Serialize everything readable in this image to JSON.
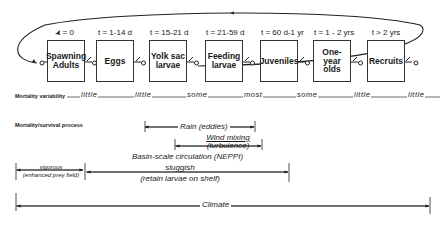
{
  "stages": [
    {
      "time": "t = 0",
      "label": "Spawning Adults"
    },
    {
      "time": "t = 1-14 d",
      "label": "Eggs"
    },
    {
      "time": "t = 15-21 d",
      "label": "Yolk sac larvae"
    },
    {
      "time": "t = 21-59 d",
      "label": "Feeding larvae"
    },
    {
      "time": "t = 60 d-1 yr",
      "label": "Juveniles"
    },
    {
      "time": "t = 1 - 2 yrs",
      "label": "One-year olds"
    },
    {
      "time": "t > 2 yrs",
      "label": "Recruits"
    }
  ],
  "rows": {
    "variability_label": "Mortality variability",
    "process_label": "Mortality/survival process"
  },
  "variability": [
    "little",
    "little",
    "some",
    "most",
    "some",
    "little",
    "little"
  ],
  "processes": {
    "rain": "Rain (eddies)",
    "wind_1": "Wind mixing",
    "wind_2": "(turbulence)",
    "basin_title": "Basin-scale circulation (NEPPI)",
    "vigorous_1": "vigorous",
    "vigorous_2": "(enhanced prey field)",
    "sluggish_1": "sluggish",
    "sluggish_2": "(retain larvae on shelf)",
    "climate": "Climate"
  }
}
